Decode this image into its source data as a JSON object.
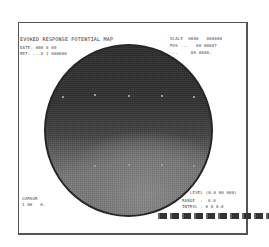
{
  "figure": {
    "title": "EVOKED RESPONSE POTENTIAL MAP",
    "top_left_info": [
      "DATE: 000 0 00",
      "REF: ...0 1 000000"
    ],
    "top_right_info": [
      "SCALE  0000   000000",
      "POS ...   00 00007",
      "...     00 0000."
    ],
    "bottom_left_info": [
      "CURSOR",
      "1 00   0."
    ],
    "bottom_right_info": [
      "LEVEL (0.0 00 000)",
      "RANGE  :  0.0",
      "INTRVL : 0 0 0.0"
    ],
    "legend_swatches": 10,
    "colors": {
      "dark": "#2e2e2e",
      "light": "#808080",
      "frame": "#555555"
    }
  }
}
